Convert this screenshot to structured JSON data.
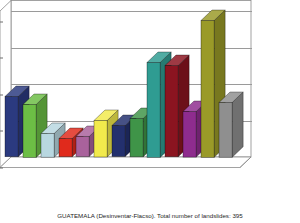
{
  "chart_data": {
    "type": "bar",
    "title": "Temporal distribution of landslides",
    "xlabel": "",
    "ylabel": "No de Desastres",
    "ylim": [
      0,
      80
    ],
    "yticks": [
      0,
      20,
      40,
      60,
      80
    ],
    "ytick_labels": [
      "0",
      "20",
      "40",
      "60",
      "80"
    ],
    "grid": true,
    "legend": "none",
    "three_d": true,
    "categories": [
      "1988",
      "1989",
      "1990",
      "1991",
      "1992",
      "1993",
      "1994",
      "1995",
      "1996",
      "1997",
      "1998",
      "1999",
      "2000"
    ],
    "values": [
      33,
      29,
      13,
      10,
      11,
      20,
      17,
      21,
      52,
      50,
      25,
      75,
      30
    ],
    "bar_colors": [
      "#2b3a80",
      "#6cbe45",
      "#b8d7e0",
      "#e02a1c",
      "#a9629c",
      "#f2ea4c",
      "#23306e",
      "#3f9448",
      "#2f9c92",
      "#8b1420",
      "#8e2c8e",
      "#9a9a28",
      "#8f8f8f"
    ],
    "annotations": []
  },
  "axes": {
    "y_title_line1": "No  de",
    "y_title_line2": "Desastres"
  },
  "footer": {
    "caption": "GUATEMALA (Desinventar-Flacso). Total number of landslides: 395"
  },
  "colors": {
    "background": "#ffffff",
    "frame": "#8a8a8a",
    "grid": "#9a9a9a",
    "text": "#1d1d1d"
  }
}
